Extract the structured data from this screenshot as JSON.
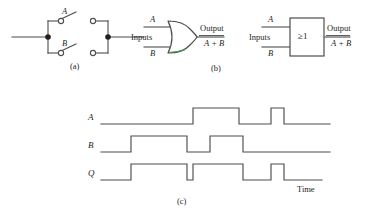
{
  "figure": {
    "stroke_color": "#4d4d4f",
    "text_color": "#231f20",
    "accent_green": "#3f9b4f",
    "background": "#ffffff"
  },
  "panel_a": {
    "caption": "(a)",
    "switch_top_label": "A",
    "switch_bottom_label": "B",
    "description": "two switches in parallel"
  },
  "panel_b": {
    "caption": "(b)",
    "distinctive_gate": {
      "input_a": "A",
      "input_b": "B",
      "inputs_label": "Inputs",
      "output_label": "Output",
      "output_expression": "A + B"
    },
    "iec_gate": {
      "input_a": "A",
      "input_b": "B",
      "inputs_label": "Inputs",
      "symbol_text": "≥1",
      "output_label": "Output",
      "output_expression": "A + B"
    }
  },
  "panel_c": {
    "caption": "(c)",
    "time_axis_label": "Time",
    "waveforms": [
      {
        "name": "A",
        "label": "A",
        "pulses": [
          {
            "start": 193,
            "end": 239
          },
          {
            "start": 271,
            "end": 284
          }
        ]
      },
      {
        "name": "B",
        "label": "B",
        "pulses": [
          {
            "start": 131,
            "end": 187
          },
          {
            "start": 210,
            "end": 243
          }
        ]
      },
      {
        "name": "Q",
        "label": "Q",
        "pulses": [
          {
            "start": 131,
            "end": 187
          },
          {
            "start": 193,
            "end": 243
          },
          {
            "start": 271,
            "end": 284
          }
        ]
      }
    ],
    "logic": "Q = A + B"
  }
}
